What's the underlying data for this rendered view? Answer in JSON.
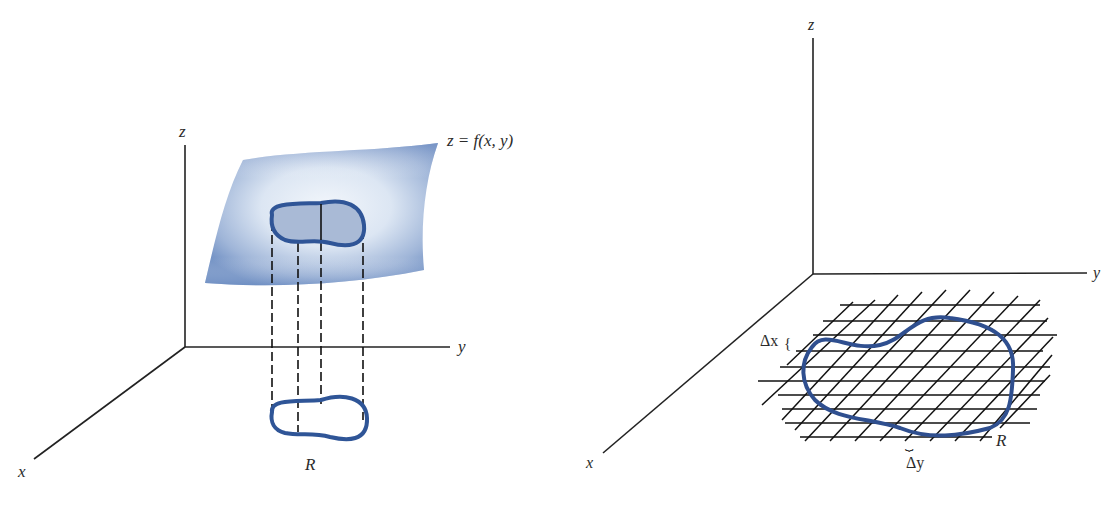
{
  "colors": {
    "axis": "#222222",
    "region_stroke": "#2f5597",
    "region_fill": "#a9bad6",
    "surface_edge": "#6f8fc3",
    "surface_center": "#eef3fa"
  },
  "left_figure": {
    "axis_labels": {
      "x": "x",
      "y": "y",
      "z": "z"
    },
    "surface_label": "z = f(x, y)",
    "region_label": "R"
  },
  "right_figure": {
    "axis_labels": {
      "x": "x",
      "y": "y",
      "z": "z"
    },
    "region_label": "R",
    "delta_x_label": "Δx",
    "delta_y_label": "Δy",
    "brace_x": "{",
    "brace_y": "⏟"
  }
}
